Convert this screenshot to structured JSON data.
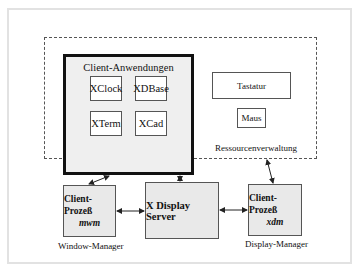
{
  "diagram": {
    "client_group": {
      "title": "Client-Anwendungen",
      "apps": [
        "XClock",
        "XDBase",
        "XTerm",
        "XCad"
      ]
    },
    "resources": {
      "label": "Ressourcenverwaltung",
      "items": [
        "Tastatur",
        "Maus"
      ]
    },
    "window_manager": {
      "title": "Client-Prozeß",
      "name": "mwm",
      "caption": "Window-Manager"
    },
    "server": {
      "title": "X Display Server"
    },
    "display_manager": {
      "title": "Client-Prozeß",
      "name": "xdm",
      "caption": "Display-Manager"
    },
    "colors": {
      "box_fill": "#e9e9e9",
      "client_group_fill": "#efefef",
      "border": "#555555",
      "frame": "#e2e2e2"
    },
    "connections": [
      {
        "from": "client_group",
        "to": "window_manager",
        "type": "bidirectional"
      },
      {
        "from": "client_group",
        "to": "server",
        "type": "bidirectional"
      },
      {
        "from": "resources",
        "to": "display_manager",
        "type": "bidirectional"
      },
      {
        "from": "window_manager",
        "to": "server",
        "type": "bidirectional"
      },
      {
        "from": "server",
        "to": "display_manager",
        "type": "bidirectional"
      }
    ]
  }
}
